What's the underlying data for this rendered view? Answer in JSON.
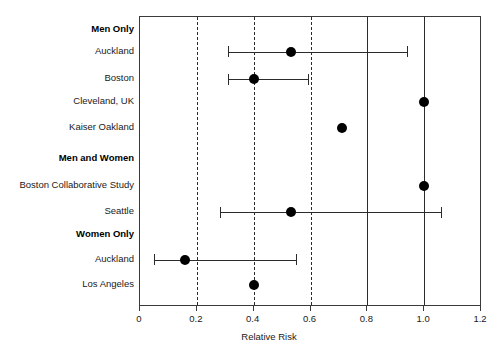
{
  "chart_data": {
    "type": "scatter",
    "title": "",
    "xlabel": "Relative Risk",
    "ylabel": "",
    "xlim": [
      0,
      1.2
    ],
    "xticks": [
      0,
      0.2,
      0.4,
      0.6,
      0.8,
      1.0,
      1.2
    ],
    "xticklabels": [
      "0",
      "0.2",
      "0.4",
      "0.6",
      "0.8",
      "1.0",
      "1.2"
    ],
    "grid": false,
    "legend": null,
    "reference_lines": [
      {
        "x": 0.2,
        "style": "dashed"
      },
      {
        "x": 0.4,
        "style": "dashed"
      },
      {
        "x": 0.6,
        "style": "dashed"
      },
      {
        "x": 0.8,
        "style": "solid"
      },
      {
        "x": 1.0,
        "style": "solid"
      }
    ],
    "rows": [
      {
        "label": "Men Only",
        "type": "group"
      },
      {
        "label": "Auckland",
        "type": "study",
        "value": 0.53,
        "ci_low": 0.31,
        "ci_high": 0.94
      },
      {
        "label": "Boston",
        "type": "study",
        "value": 0.4,
        "ci_low": 0.31,
        "ci_high": 0.59
      },
      {
        "label": "Cleveland, UK",
        "type": "study",
        "value": 1.0,
        "ci_low": null,
        "ci_high": null
      },
      {
        "label": "Kaiser Oakland",
        "type": "study",
        "value": 0.71,
        "ci_low": null,
        "ci_high": null
      },
      {
        "label": "Men and Women",
        "type": "group"
      },
      {
        "label": "Boston Collaborative Study",
        "type": "study",
        "value": 1.0,
        "ci_low": null,
        "ci_high": null
      },
      {
        "label": "Seattle",
        "type": "study",
        "value": 0.53,
        "ci_low": 0.28,
        "ci_high": 1.06
      },
      {
        "label": "Women Only",
        "type": "group"
      },
      {
        "label": "Auckland",
        "type": "study",
        "value": 0.16,
        "ci_low": 0.05,
        "ci_high": 0.55
      },
      {
        "label": "Los Angeles",
        "type": "study",
        "value": 0.4,
        "ci_low": null,
        "ci_high": null
      }
    ]
  },
  "colors": {
    "marker": "#000000",
    "line": "#2b2b2b",
    "frame": "#3a3a3a",
    "background": "#ffffff",
    "text": "#1a1a1a"
  }
}
